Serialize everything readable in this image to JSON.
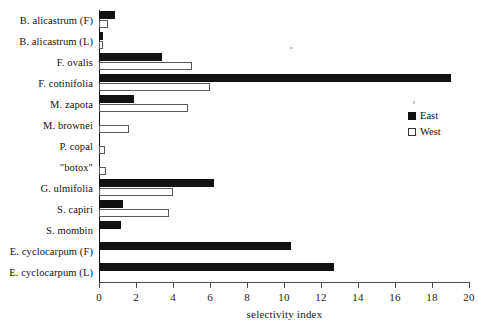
{
  "chart_data": {
    "type": "bar",
    "orientation": "horizontal",
    "title": "",
    "subtitle": "",
    "xlabel": "selectivity index",
    "ylabel": "",
    "xlim": [
      0,
      20
    ],
    "xticks": [
      0,
      2,
      4,
      6,
      8,
      10,
      12,
      14,
      16,
      18,
      20
    ],
    "grid": false,
    "legend_position": "right",
    "legend": [
      "East",
      "West"
    ],
    "categories": [
      "B. alicastrum (F)",
      "B. alicastrum (L)",
      "F. ovalis",
      "F. cotinifolia",
      "M. zapota",
      "M. brownei",
      "P. copal",
      "\"botox\"",
      "G. ulmifolia",
      "S. capiri",
      "S. mombin",
      "E. cyclocarpum (F)",
      "E. cyclocarpum (L)"
    ],
    "series": [
      {
        "name": "East",
        "color": "#111111",
        "values": [
          0.85,
          0.15,
          3.4,
          19.0,
          1.9,
          0,
          0,
          0,
          6.2,
          1.3,
          1.2,
          10.4,
          12.7
        ]
      },
      {
        "name": "West",
        "color": "#ffffff",
        "values": [
          0.5,
          0.15,
          5.0,
          6.0,
          4.8,
          1.6,
          0.35,
          0.4,
          4.0,
          3.8,
          0,
          0,
          0
        ]
      }
    ]
  },
  "axis": {
    "x_label": "selectivity index",
    "tick_labels": [
      "0",
      "2",
      "4",
      "6",
      "8",
      "10",
      "12",
      "14",
      "16",
      "18",
      "20"
    ]
  },
  "legend": {
    "east_label": "East",
    "west_label": "West"
  }
}
